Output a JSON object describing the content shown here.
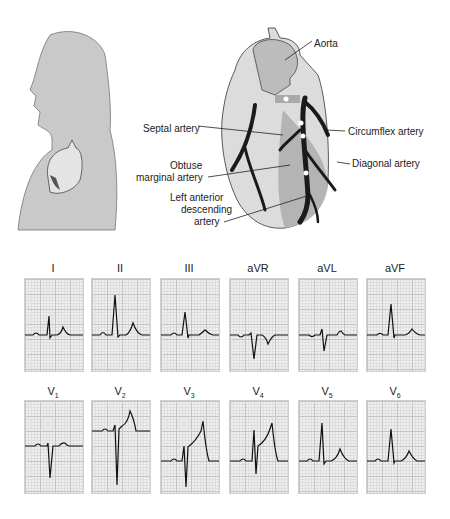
{
  "labels": {
    "aorta": "Aorta",
    "septal": "Septal artery",
    "circumflex": "Circumflex artery",
    "obtuse1": "Obtuse",
    "obtuse2": "marginal artery",
    "diagonal": "Diagonal artery",
    "lad1": "Left anterior",
    "lad2": "descending",
    "lad3": "artery"
  },
  "leads_row1": [
    "I",
    "II",
    "III",
    "aVR",
    "aVL",
    "aVF"
  ],
  "leads_row2": [
    {
      "base": "V",
      "sub": "1"
    },
    {
      "base": "V",
      "sub": "2"
    },
    {
      "base": "V",
      "sub": "3"
    },
    {
      "base": "V",
      "sub": "4"
    },
    {
      "base": "V",
      "sub": "5"
    },
    {
      "base": "V",
      "sub": "6"
    }
  ],
  "colors": {
    "silhouette": "#c9c9c9",
    "heart": "#d8d8d8",
    "artery": "#1a1a1a",
    "grid": "#c4c4c4"
  }
}
